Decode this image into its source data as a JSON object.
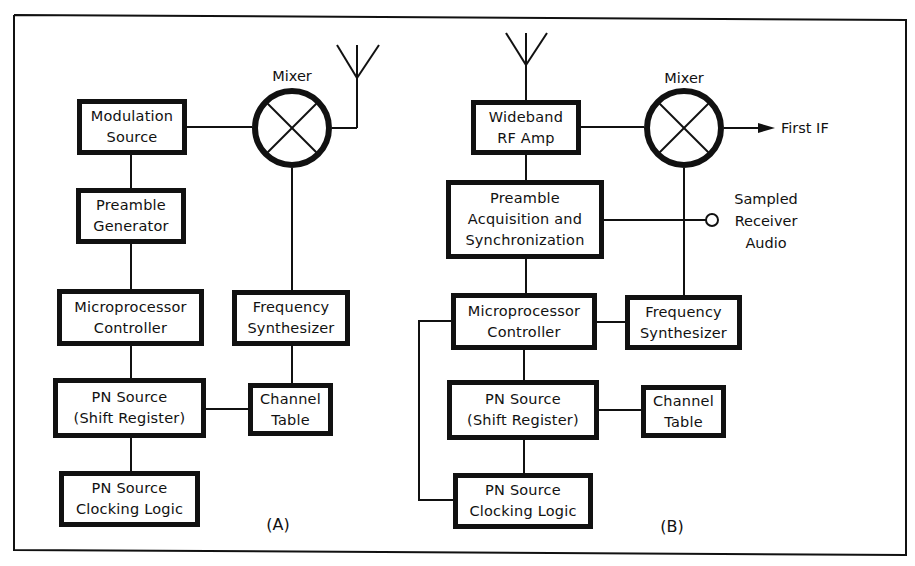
{
  "colors": {
    "line": "#111111",
    "background": "#ffffff"
  },
  "panel_a": {
    "caption": "(A)",
    "mixer_label": "Mixer",
    "blocks": {
      "modulation_source": [
        "Modulation",
        "Source"
      ],
      "preamble_generator": [
        "Preamble",
        "Generator"
      ],
      "microprocessor_controller": [
        "Microprocessor",
        "Controller"
      ],
      "frequency_synthesizer": [
        "Frequency",
        "Synthesizer"
      ],
      "pn_source_shift_register": [
        "PN Source",
        "(Shift Register)"
      ],
      "channel_table": [
        "Channel",
        "Table"
      ],
      "pn_source_clocking_logic": [
        "PN Source",
        "Clocking Logic"
      ]
    },
    "icons": [
      "antenna-icon",
      "mixer-icon"
    ]
  },
  "panel_b": {
    "caption": "(B)",
    "mixer_label": "Mixer",
    "output_label": "First IF",
    "audio_label": [
      "Sampled",
      "Receiver",
      "Audio"
    ],
    "blocks": {
      "wideband_rf_amp": [
        "Wideband",
        "RF Amp"
      ],
      "preamble_acquisition": [
        "Preamble",
        "Acquisition and",
        "Synchronization"
      ],
      "microprocessor_controller": [
        "Microprocessor",
        "Controller"
      ],
      "frequency_synthesizer": [
        "Frequency",
        "Synthesizer"
      ],
      "pn_source_shift_register": [
        "PN Source",
        "(Shift Register)"
      ],
      "channel_table": [
        "Channel",
        "Table"
      ],
      "pn_source_clocking_logic": [
        "PN Source",
        "Clocking Logic"
      ]
    },
    "icons": [
      "antenna-icon",
      "mixer-icon",
      "arrow-right-icon",
      "output-terminal-icon"
    ]
  }
}
